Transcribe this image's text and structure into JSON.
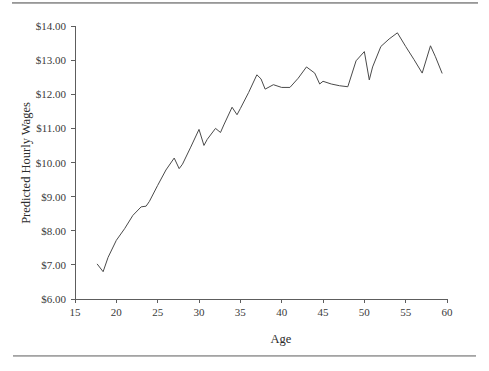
{
  "figure": {
    "background": "#ffffff",
    "rule_color": "#9a9a9a",
    "line_color": "#4a4a4a",
    "axis_color": "#5d5d5d",
    "text_color": "#2c2c2c"
  },
  "chart_data": {
    "type": "line",
    "title": "",
    "subtitle": "",
    "xlabel": "Age",
    "ylabel": "Predicted Hourly Wages",
    "xlim": [
      15,
      60
    ],
    "ylim": [
      6.0,
      14.0
    ],
    "xticks": [
      15,
      20,
      25,
      30,
      35,
      40,
      45,
      50,
      55,
      60
    ],
    "xtick_labels": [
      "15",
      "20",
      "25",
      "30",
      "35",
      "40",
      "45",
      "50",
      "55",
      "60"
    ],
    "yticks": [
      6.0,
      7.0,
      8.0,
      9.0,
      10.0,
      11.0,
      12.0,
      13.0,
      14.0
    ],
    "ytick_labels": [
      "$6.00",
      "$7.00",
      "$8.00",
      "$9.00",
      "$10.00",
      "$11.00",
      "$12.00",
      "$13.00",
      "$14.00"
    ],
    "grid": false,
    "legend": false,
    "legend_position": "none",
    "series": [
      {
        "name": "Predicted Hourly Wages",
        "color": "#4a4a4a",
        "x": [
          17.7,
          18.4,
          19.0,
          20.0,
          21.0,
          22.0,
          23.0,
          23.6,
          24.0,
          25.0,
          26.0,
          27.0,
          27.6,
          28.0,
          29.0,
          30.0,
          30.6,
          31.0,
          32.0,
          32.6,
          33.0,
          34.0,
          34.6,
          35.0,
          36.0,
          37.0,
          37.5,
          38.0,
          39.0,
          40.0,
          41.0,
          42.0,
          43.0,
          44.0,
          44.6,
          45.0,
          46.0,
          47.0,
          48.0,
          49.0,
          50.0,
          50.6,
          51.0,
          52.0,
          53.0,
          54.0,
          55.0,
          56.0,
          57.0,
          58.0,
          58.6,
          59.4
        ],
        "y": [
          7.02,
          6.8,
          7.22,
          7.72,
          8.06,
          8.45,
          8.7,
          8.72,
          8.86,
          9.33,
          9.78,
          10.13,
          9.82,
          9.95,
          10.45,
          10.97,
          10.5,
          10.68,
          11.0,
          10.88,
          11.1,
          11.62,
          11.4,
          11.58,
          12.05,
          12.57,
          12.45,
          12.15,
          12.28,
          12.2,
          12.2,
          12.47,
          12.8,
          12.62,
          12.3,
          12.38,
          12.3,
          12.25,
          12.22,
          12.98,
          13.25,
          12.42,
          12.8,
          13.4,
          13.62,
          13.8,
          13.4,
          13.02,
          12.62,
          13.42,
          13.1,
          12.62
        ]
      }
    ]
  }
}
